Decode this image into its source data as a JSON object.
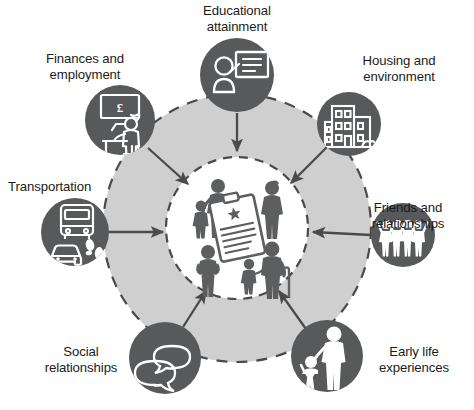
{
  "diagram": {
    "type": "hub-and-spoke",
    "title": "",
    "center": {
      "label": "",
      "icon": "family-group-with-clipboard-icon",
      "description": "Group of people figures surrounding a clipboard document",
      "fill": "#ffffff"
    },
    "ring": {
      "fill": "#cfcfcf",
      "border_style": "dashed",
      "border_color": "#4a4a4a"
    },
    "node_fill": "#58595b",
    "node_icon_color": "#ffffff",
    "arrow_color": "#4a4a4a",
    "arrow_direction": "inward",
    "nodes": [
      {
        "id": "educational-attainment",
        "label": "Educational\nattainment",
        "icon": "presenter-whiteboard-icon",
        "angle_deg": 270
      },
      {
        "id": "housing-and-environment",
        "label": "Housing and\nenvironment",
        "icon": "apartment-building-icon",
        "angle_deg": 315
      },
      {
        "id": "friends-and-relationships",
        "label": "Friends and\nrelationships",
        "icon": "four-people-cheering-icon",
        "angle_deg": 0
      },
      {
        "id": "early-life-experiences",
        "label": "Early life\nexperiences",
        "icon": "adult-and-child-icon",
        "angle_deg": 45
      },
      {
        "id": "social-relationships",
        "label": "Social\nrelationships",
        "icon": "speech-bubbles-icon",
        "angle_deg": 90
      },
      {
        "id": "transportation",
        "label": "Transportation",
        "icon": "bus-car-footprints-icon",
        "angle_deg": 180
      },
      {
        "id": "finances-and-employment",
        "label": "Finances and\nemployment",
        "icon": "desk-worker-pound-board-icon",
        "angle_deg": 225
      }
    ],
    "labels": {
      "educational_attainment": "Educational\nattainment",
      "housing_and_environment": "Housing and\nenvironment",
      "friends_and_relationships": "Friends and\nrelationships",
      "early_life_experiences": "Early life\nexperiences",
      "social_relationships": "Social\nrelationships",
      "transportation": "Transportation",
      "finances_and_employment": "Finances and\nemployment"
    }
  }
}
